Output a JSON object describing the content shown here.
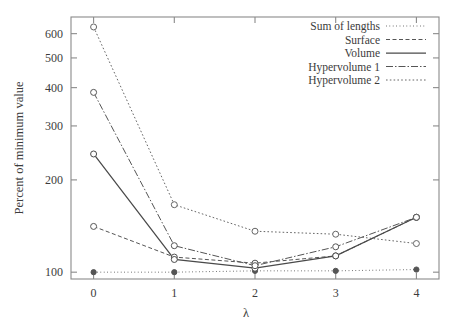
{
  "chart_data": {
    "type": "line",
    "title": "",
    "xlabel": "λ",
    "ylabel": "Percent of minimum value",
    "x": [
      0,
      1,
      2,
      3,
      4
    ],
    "xticklabels": [
      "0",
      "1",
      "2",
      "3",
      "4"
    ],
    "xlim": [
      -0.28,
      4.28
    ],
    "yscale": "log",
    "ylim": [
      95,
      680
    ],
    "yticks": [
      100,
      200,
      300,
      400,
      500,
      600
    ],
    "yticklabels": [
      "100",
      "200",
      "300",
      "400",
      "500",
      "600"
    ],
    "grid": false,
    "legend_position": "top-right",
    "series": [
      {
        "name": "Sum of lengths",
        "values": [
          100,
          100,
          101,
          101,
          102
        ],
        "dash": "0.8 2.6",
        "marker": "filled-circle",
        "color": "#555555"
      },
      {
        "name": "Surface",
        "values": [
          141,
          112,
          107,
          113,
          151
        ],
        "dash": "4 2.5",
        "marker": "open-circle",
        "color": "#555555"
      },
      {
        "name": "Volume",
        "values": [
          243,
          110,
          103,
          113,
          151
        ],
        "dash": "none",
        "marker": "open-circle",
        "color": "#4a4a4a"
      },
      {
        "name": "Hypervolume 1",
        "values": [
          386,
          122,
          105,
          121,
          151
        ],
        "dash": "7 2 1.5 2",
        "marker": "open-circle",
        "color": "#555555"
      },
      {
        "name": "Hypervolume 2",
        "values": [
          631,
          166,
          136,
          133,
          124
        ],
        "dash": "1.6 2.2",
        "marker": "open-circle",
        "color": "#666666"
      }
    ]
  },
  "legend": {
    "entries": [
      {
        "label": "Sum of lengths"
      },
      {
        "label": "Surface"
      },
      {
        "label": "Volume"
      },
      {
        "label": "Hypervolume 1"
      },
      {
        "label": "Hypervolume 2"
      }
    ]
  },
  "axes": {
    "y_title": "Percent of minimum value",
    "x_title": "λ"
  }
}
